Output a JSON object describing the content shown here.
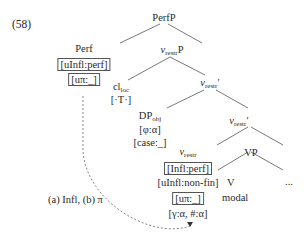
{
  "example_number": "(58)",
  "nodes": {
    "root": "PerfP",
    "perf": "Perf",
    "perf_feature1": "[uInfl:perf]",
    "perf_feature2": "[uπ:_]",
    "vrestrP": {
      "head": "v",
      "sub": "restr",
      "suffix": "P"
    },
    "cl": {
      "head": "cl",
      "sub": "loc",
      "feature": "[·T·]"
    },
    "vrestr_bar1": {
      "head": "v",
      "sub": "restr",
      "suffix": "′"
    },
    "dp": {
      "head": "DP",
      "sub": "obj",
      "feature1": "[φ:α]",
      "feature2": "[case:_]"
    },
    "vrestr_bar2": {
      "head": "v",
      "sub": "restr",
      "suffix": "′"
    },
    "vrestr_head": {
      "head": "v",
      "sub": "restr",
      "feature_boxed": "[Infl:perf]",
      "feature2": "[uInfl:non-fin]",
      "feature3_boxed": "[uπ:_]",
      "feature4": "[γ:α, #:α]"
    },
    "vp": "VP",
    "v": "V",
    "v_label": "modal",
    "ellipsis": "..."
  },
  "arrow_label": "(a) Infl, (b) π"
}
